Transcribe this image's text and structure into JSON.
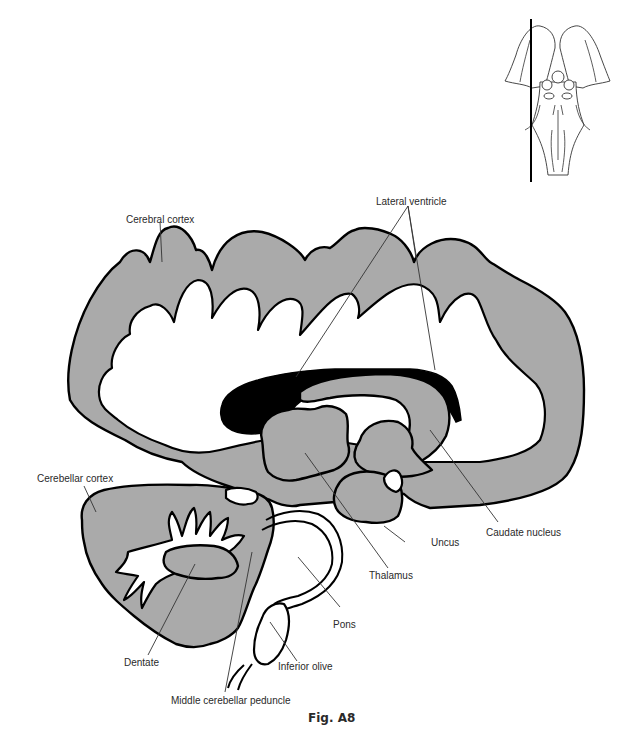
{
  "figure": {
    "caption": "Fig. A8",
    "tissue_color": "#aaaaaa",
    "ventricle_color": "#000000",
    "outline_color": "#000000",
    "reference_inset": {
      "description": "ventral view of brainstem with sagittal section line on left side"
    }
  },
  "labels": {
    "cerebral_cortex": "Cerebral cortex",
    "lateral_ventricle": "Lateral ventricle",
    "cerebellar_cortex": "Cerebellar cortex",
    "caudate_nucleus": "Caudate nucleus",
    "uncus": "Uncus",
    "thalamus": "Thalamus",
    "pons": "Pons",
    "dentate": "Dentate",
    "inferior_olive": "Inferior olive",
    "middle_cerebellar_peduncle": "Middle cerebellar peduncle"
  }
}
